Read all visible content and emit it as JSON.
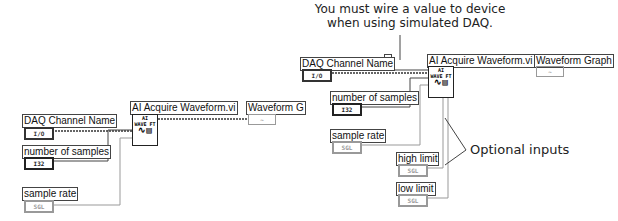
{
  "left_diagram": {
    "daq_channel": {
      "label": "DAQ Channel Name",
      "terminal": "I/O"
    },
    "samples": {
      "label": "number of samples",
      "terminal": "I32"
    },
    "rate": {
      "label": "sample rate",
      "terminal": "SGL"
    },
    "vi": {
      "label": "AI Acquire Waveform.vi",
      "icon_line1": "AI",
      "icon_line2": "WAVE FT"
    },
    "graph": {
      "label": "Waveform G",
      "terminal": "~"
    }
  },
  "right_diagram": {
    "constant": "1",
    "daq_channel": {
      "label": "DAQ Channel Name",
      "terminal": "I/O"
    },
    "samples": {
      "label": "number of samples",
      "terminal": "I32"
    },
    "rate": {
      "label": "sample rate",
      "terminal": "SGL"
    },
    "high": {
      "label": "high limit",
      "terminal": "SGL"
    },
    "low": {
      "label": "low limit",
      "terminal": "SGL"
    },
    "vi": {
      "label": "AI Acquire Waveform.vi",
      "icon_line1": "AI",
      "icon_line2": "WAVE FT"
    },
    "graph": {
      "label": "Waveform Graph",
      "terminal": "~"
    }
  },
  "annotations": {
    "device_note_1": "You must wire a value to device",
    "device_note_bold": "device",
    "device_note_2": "when using simulated DAQ.",
    "optional": "Optional inputs"
  }
}
